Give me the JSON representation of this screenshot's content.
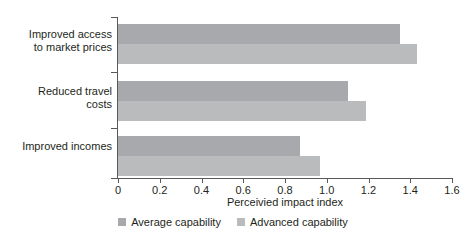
{
  "chart_data": {
    "type": "bar",
    "orientation": "horizontal",
    "title": "",
    "xlabel": "Perceivied impact index",
    "ylabel": "",
    "xlim": [
      0,
      1.6
    ],
    "xticks": [
      "0",
      "0.2",
      "0.4",
      "0.6",
      "0.8",
      "1.0",
      "1.2",
      "1.4",
      "1.6"
    ],
    "xtick_values": [
      0,
      0.2,
      0.4,
      0.6,
      0.8,
      1.0,
      1.2,
      1.4,
      1.6
    ],
    "grid": false,
    "legend_position": "bottom-center",
    "categories": [
      "Improved access to market prices",
      "Reduced travel costs",
      "Improved incomes"
    ],
    "category_lines": [
      [
        "Improved access",
        "to market prices"
      ],
      [
        "Reduced travel",
        "costs"
      ],
      [
        "Improved incomes"
      ]
    ],
    "series": [
      {
        "name": "Average capability",
        "color": "#a7a9ac",
        "values": [
          1.35,
          1.1,
          0.87
        ]
      },
      {
        "name": "Advanced capability",
        "color": "#b9bbbd",
        "values": [
          1.43,
          1.19,
          0.97
        ]
      }
    ]
  },
  "legend": {
    "items": [
      {
        "label": "Average capability",
        "color": "#a7a9ac"
      },
      {
        "label": "Advanced capability",
        "color": "#b9bbbd"
      }
    ]
  },
  "axis": {
    "x_title": "Perceivied impact index"
  }
}
